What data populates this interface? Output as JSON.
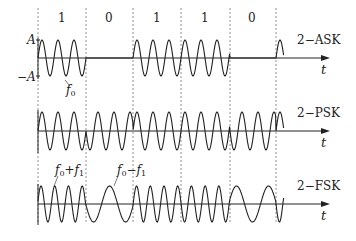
{
  "bits": [
    "1",
    "0",
    "1",
    "1",
    "0"
  ],
  "boundaries_x": [
    38,
    86,
    133,
    181,
    230,
    276
  ],
  "amplitude_labels": {
    "positive": "A",
    "negative": "−A"
  },
  "time_label": "t",
  "signals": [
    {
      "name": "2−ASK",
      "baseline_y": 58,
      "amp": 18,
      "type": "ask",
      "cycles_per_bit": 3
    },
    {
      "name": "2−PSK",
      "baseline_y": 131,
      "amp": 19,
      "type": "psk",
      "cycles_per_bit": 3
    },
    {
      "name": "2−FSK",
      "baseline_y": 204,
      "amp": 18,
      "type": "fsk",
      "cycles_high": 3.5,
      "cycles_low": 1.5
    }
  ],
  "annotations": {
    "f0": {
      "base": "f",
      "sub": "0"
    },
    "f0_plus_f1": {
      "base1": "f",
      "sub1": "0",
      "op": "+",
      "base2": "f",
      "sub2": "1"
    },
    "f0_minus_f1": {
      "base1": "f",
      "sub1": "0",
      "op": "−",
      "base2": "f",
      "sub2": "1"
    }
  },
  "colors": {
    "stroke": "#222222",
    "dash": "#777777"
  }
}
